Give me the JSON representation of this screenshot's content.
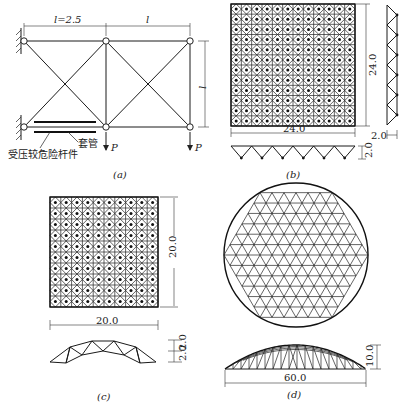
{
  "figure_a": {
    "caption": "(a)",
    "span_left_label": "l=2.5",
    "span_right_label": "l",
    "height_label": "l",
    "load_left": "P",
    "load_right": "P",
    "sleeve_label": "套管",
    "member_label": "受压较危险杆件"
  },
  "figure_b": {
    "caption": "(b)",
    "width_label": "24.0",
    "height_label": "24.0",
    "side_depth_label": "2.0",
    "bottom_depth_label": "2.0"
  },
  "figure_c": {
    "caption": "(c)",
    "width_label": "20.0",
    "height_label": "20.0",
    "rise_label_1": "2.0",
    "rise_label_2": "2.0"
  },
  "figure_d": {
    "caption": "(d)",
    "span_label": "60.0",
    "rise_label": "10.0"
  }
}
